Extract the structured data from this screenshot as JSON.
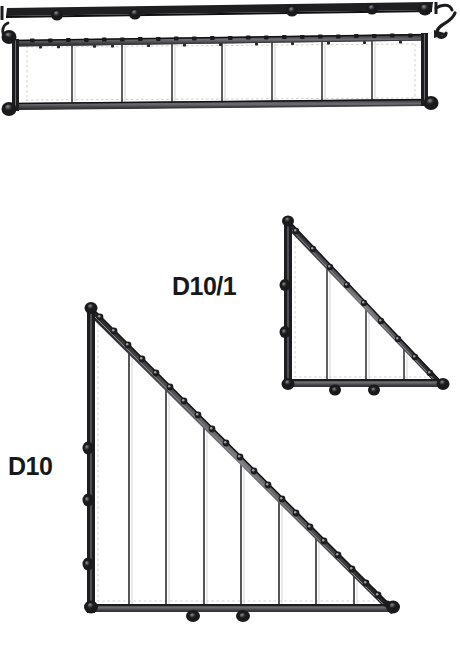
{
  "sheet": {
    "kind": "technical-assembly-drawing",
    "background_color": "#ffffff",
    "ink_color": "#1a1a1c",
    "hairline_color": "#b9b9bc",
    "width": 460,
    "height": 672
  },
  "labels": {
    "small_triangle": "D10/1",
    "large_triangle": "D10"
  },
  "parts": [
    {
      "id": "top-girder",
      "name": "long-girder-panel",
      "label": "",
      "shape": "rectangle",
      "cropped": true,
      "bays": 8,
      "internal_dividers": 7,
      "bounds": {
        "x": 10,
        "y": 35,
        "width": 428,
        "height": 73
      },
      "rivets_top": 24,
      "corner_bolts": 4,
      "has_hook": true
    },
    {
      "id": "small-triangle",
      "name": "small-right-triangle",
      "label": "D10/1",
      "shape": "right-triangle",
      "apex": {
        "x": 288,
        "y": 220
      },
      "bottom_left": {
        "x": 288,
        "y": 385
      },
      "bottom_right": {
        "x": 443,
        "y": 385
      },
      "internal_struts": 3,
      "hypotenuse_rivets": 9,
      "bottom_bolts": 2,
      "left_bolts": 2
    },
    {
      "id": "large-triangle",
      "name": "large-right-triangle",
      "label": "D10",
      "shape": "right-triangle",
      "apex": {
        "x": 91,
        "y": 307
      },
      "bottom_left": {
        "x": 91,
        "y": 610
      },
      "bottom_right": {
        "x": 394,
        "y": 610
      },
      "internal_struts": 7,
      "hypotenuse_rivets": 22,
      "bottom_bolts": 2,
      "left_bolts": 3
    }
  ]
}
